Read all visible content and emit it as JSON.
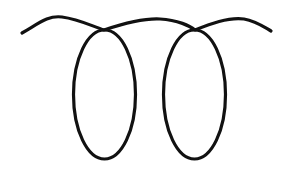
{
  "drawing": {
    "description": "Line drawing of a wavy horizontal line with two hanging elongated loops",
    "stroke_color": "#111111",
    "background_color": "#ffffff",
    "stroke_width": 3.2,
    "wave_path": "M22,33 C38,24 48,15 62,17 C78,19 92,26 104,30 C122,24 142,18 160,19 C178,20 190,26 195,30 C210,24 228,17 244,19 C256,21 264,27 271,31",
    "loops": [
      {
        "name": "left-loop",
        "cx": 104.5,
        "cy": 94.5,
        "rx": 31,
        "ry": 64.5
      },
      {
        "name": "right-loop",
        "cx": 194.5,
        "cy": 94.5,
        "rx": 31,
        "ry": 64.5
      }
    ]
  }
}
